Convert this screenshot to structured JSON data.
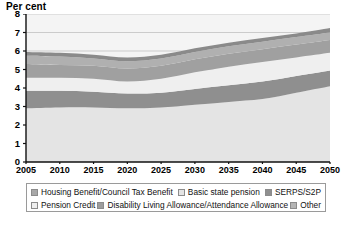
{
  "chart": {
    "axis_title": "Per cent",
    "ylabel": "Per cent",
    "xlabel": ""
  },
  "yticks": [
    "0",
    "1",
    "2",
    "3",
    "4",
    "5",
    "6",
    "7",
    "8"
  ],
  "xticks": [
    "2005",
    "2010",
    "2015",
    "2020",
    "2025",
    "2030",
    "2035",
    "2040",
    "2045",
    "2050"
  ],
  "legend": {
    "row1": [
      {
        "label": "Housing Benefit/Council Tax Benefit",
        "color": "#a8a8a8",
        "icon": "legend-swatch"
      },
      {
        "label": "Basic state pension",
        "color": "#e4e4e4",
        "icon": "legend-swatch"
      },
      {
        "label": "SERPS/S2P",
        "color": "#8f8f8f",
        "icon": "legend-swatch"
      }
    ],
    "row2": [
      {
        "label": "Pension Credit",
        "color": "#efefef",
        "icon": "legend-swatch"
      },
      {
        "label": "Disability Living Allowance/Attendance Allowance",
        "color": "#9d9d9d",
        "icon": "legend-swatch"
      },
      {
        "label": "Other",
        "color": "#b5b5b5",
        "icon": "legend-swatch"
      }
    ]
  },
  "colors": {
    "basic_state_pension": "#e4e4e4",
    "serps_s2p": "#8f8f8f",
    "pension_credit": "#efefef",
    "disability_living_allowance": "#a0a0a0",
    "housing_benefit": "#b0b0b0",
    "other": "#8a8a8a",
    "plot_background": "#f4f4f4",
    "gridline": "#b9b9b9",
    "axis": "#111111"
  },
  "chart_data": {
    "type": "area",
    "title": "",
    "subtitle": "",
    "xlabel": "",
    "ylabel": "Per cent",
    "xlim": [
      2005,
      2050
    ],
    "ylim": [
      0,
      8
    ],
    "grid": true,
    "stacked": true,
    "legend_position": "bottom",
    "x": [
      2005,
      2010,
      2015,
      2020,
      2025,
      2030,
      2035,
      2040,
      2045,
      2050
    ],
    "series": [
      {
        "name": "Basic state pension",
        "color": "#e4e4e4",
        "values": [
          2.9,
          2.95,
          2.95,
          2.9,
          2.95,
          3.1,
          3.25,
          3.4,
          3.75,
          4.1
        ]
      },
      {
        "name": "SERPS/S2P",
        "color": "#8f8f8f",
        "values": [
          0.95,
          0.9,
          0.85,
          0.8,
          0.8,
          0.85,
          0.9,
          0.95,
          0.9,
          0.85
        ]
      },
      {
        "name": "Pension Credit",
        "color": "#efefef",
        "values": [
          0.7,
          0.7,
          0.7,
          0.65,
          0.75,
          0.9,
          1.0,
          1.05,
          1.0,
          0.95
        ]
      },
      {
        "name": "Disability Living Allowance/Attendance Allowance",
        "color": "#a0a0a0",
        "values": [
          0.75,
          0.7,
          0.7,
          0.7,
          0.7,
          0.7,
          0.7,
          0.7,
          0.7,
          0.7
        ]
      },
      {
        "name": "Housing Benefit/Council Tax Benefit",
        "color": "#b0b0b0",
        "values": [
          0.45,
          0.45,
          0.4,
          0.4,
          0.4,
          0.4,
          0.4,
          0.4,
          0.4,
          0.4
        ]
      },
      {
        "name": "Other",
        "color": "#8a8a8a",
        "values": [
          0.2,
          0.2,
          0.2,
          0.2,
          0.2,
          0.2,
          0.2,
          0.2,
          0.2,
          0.25
        ]
      }
    ],
    "totals": [
      5.95,
      5.9,
      5.8,
      5.65,
      5.8,
      6.15,
      6.45,
      6.7,
      6.95,
      7.25
    ]
  }
}
